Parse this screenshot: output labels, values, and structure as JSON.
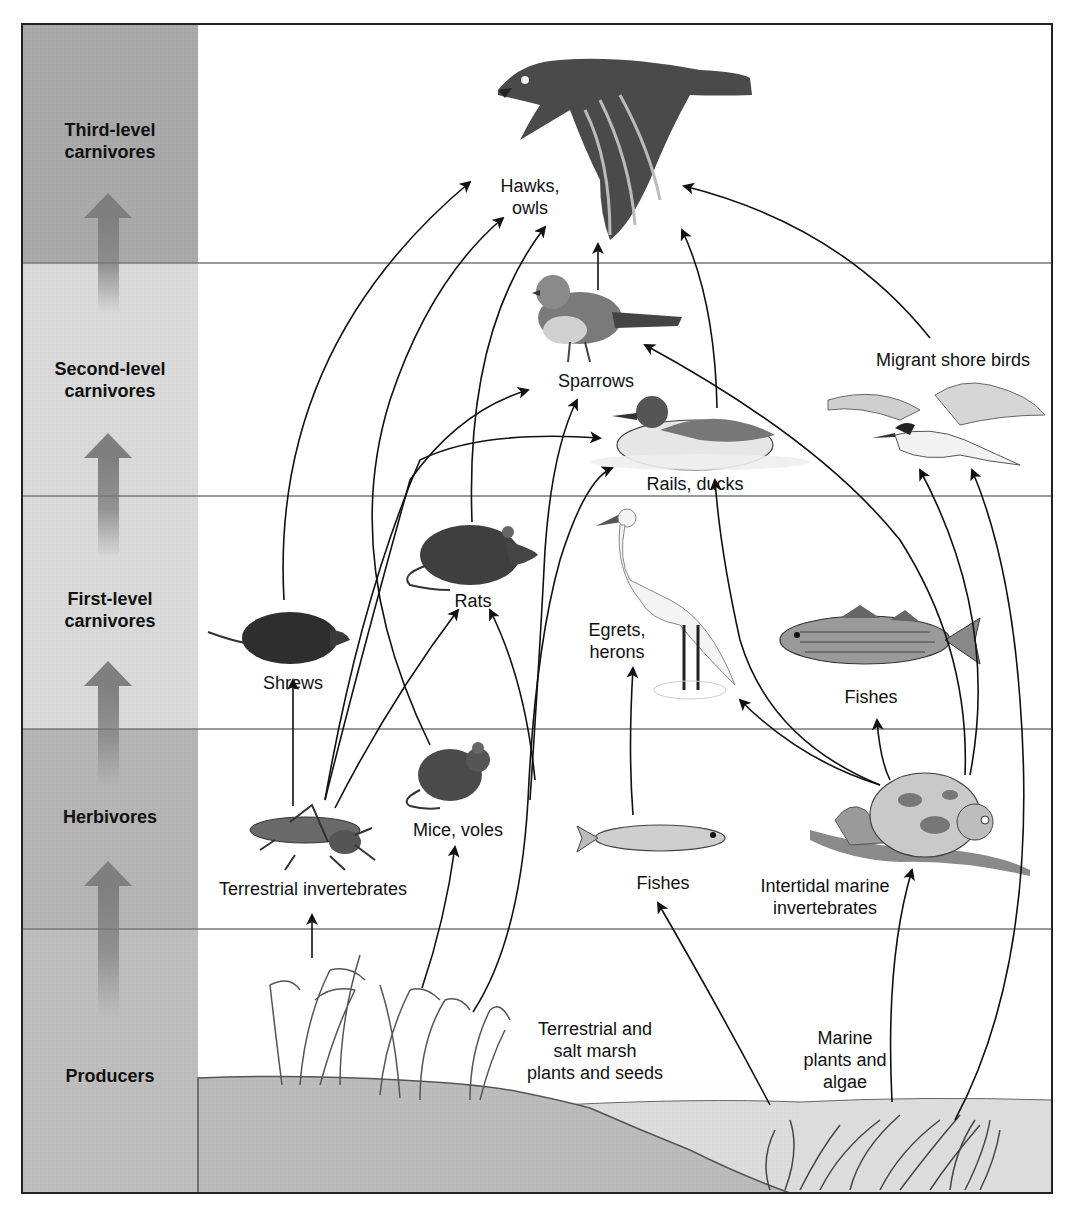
{
  "colors": {
    "dark_band": "#a9a9a9",
    "light_band": "#d9d9d9",
    "ground": "#b9b9b9",
    "water": "#dcdcdc",
    "arrow": "#111111",
    "frame": "#222222"
  },
  "trophic_levels": [
    {
      "id": "third",
      "label_line1": "Third-level",
      "label_line2": "carnivores"
    },
    {
      "id": "second",
      "label_line1": "Second-level",
      "label_line2": "carnivores"
    },
    {
      "id": "first",
      "label_line1": "First-level",
      "label_line2": "carnivores"
    },
    {
      "id": "herbivores",
      "label_line1": "Herbivores",
      "label_line2": ""
    },
    {
      "id": "producers",
      "label_line1": "Producers",
      "label_line2": ""
    }
  ],
  "organisms": {
    "hawks": {
      "line1": "Hawks,",
      "line2": "owls",
      "icon": "hawk-icon"
    },
    "sparrows": {
      "line1": "Sparrows",
      "icon": "sparrow-icon"
    },
    "rails": {
      "line1": "Rails, ducks",
      "icon": "duck-icon"
    },
    "shorebirds": {
      "line1": "Migrant shore birds",
      "icon": "tern-icon"
    },
    "shrews": {
      "line1": "Shrews",
      "icon": "shrew-icon"
    },
    "rats": {
      "line1": "Rats",
      "icon": "rat-icon"
    },
    "egrets": {
      "line1": "Egrets,",
      "line2": "herons",
      "icon": "egret-icon"
    },
    "fishes_upper": {
      "line1": "Fishes",
      "icon": "striped-fish-icon"
    },
    "terr_invert": {
      "line1": "Terrestrial invertebrates",
      "icon": "grasshopper-icon"
    },
    "mice": {
      "line1": "Mice, voles",
      "icon": "mouse-icon"
    },
    "fishes_lower": {
      "line1": "Fishes",
      "icon": "small-fish-icon"
    },
    "marine_invert": {
      "line1": "Intertidal marine",
      "line2": "invertebrates",
      "icon": "snail-icon"
    },
    "terr_plants": {
      "line1": "Terrestrial and",
      "line2": "salt marsh",
      "line3": "plants and seeds",
      "icon": "marsh-grass-icon"
    },
    "marine_plants": {
      "line1": "Marine",
      "line2": "plants and",
      "line3": "algae",
      "icon": "seaweed-icon"
    }
  },
  "links": [
    [
      "Terrestrial invertebrates",
      "Shrews"
    ],
    [
      "Terrestrial invertebrates",
      "Rats"
    ],
    [
      "Terrestrial invertebrates",
      "Sparrows"
    ],
    [
      "Terrestrial invertebrates",
      "Rails, ducks"
    ],
    [
      "Terrestrial and salt marsh plants and seeds",
      "Terrestrial invertebrates"
    ],
    [
      "Terrestrial and salt marsh plants and seeds",
      "Mice, voles"
    ],
    [
      "Terrestrial and salt marsh plants and seeds",
      "Rails, ducks"
    ],
    [
      "Terrestrial and salt marsh plants and seeds",
      "Sparrows"
    ],
    [
      "Terrestrial and salt marsh plants and seeds",
      "Rats"
    ],
    [
      "Mice, voles",
      "Hawks, owls"
    ],
    [
      "Shrews",
      "Hawks, owls"
    ],
    [
      "Rats",
      "Hawks, owls"
    ],
    [
      "Sparrows",
      "Hawks, owls"
    ],
    [
      "Rails, ducks",
      "Hawks, owls"
    ],
    [
      "Migrant shore birds",
      "Hawks, owls"
    ],
    [
      "Marine plants and algae",
      "Fishes"
    ],
    [
      "Marine plants and algae",
      "Intertidal marine invertebrates"
    ],
    [
      "Marine plants and algae",
      "Migrant shore birds"
    ],
    [
      "Fishes",
      "Egrets, herons"
    ],
    [
      "Intertidal marine invertebrates",
      "Egrets, herons"
    ],
    [
      "Intertidal marine invertebrates",
      "Fishes"
    ],
    [
      "Intertidal marine invertebrates",
      "Rails, ducks"
    ],
    [
      "Intertidal marine invertebrates",
      "Sparrows"
    ],
    [
      "Intertidal marine invertebrates",
      "Migrant shore birds"
    ]
  ]
}
